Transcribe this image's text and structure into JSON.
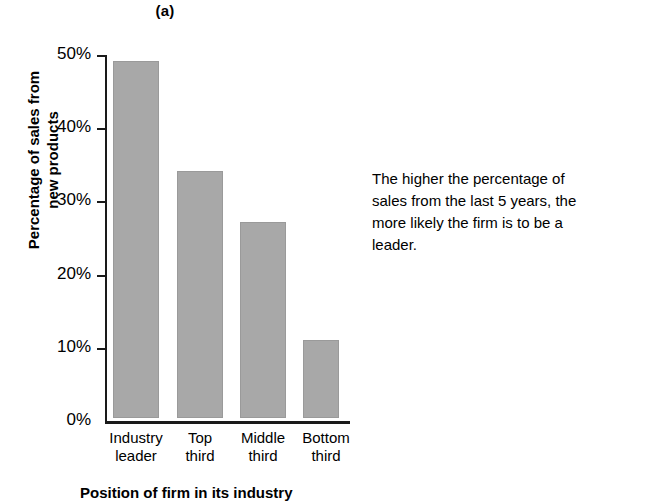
{
  "chart_data": {
    "type": "bar",
    "title": "(a)",
    "xlabel": "Position of firm in its industry",
    "ylabel_lines": [
      "Percentage of sales from",
      "new products"
    ],
    "ylabel": "Percentage of sales from new products",
    "categories": [
      "Industry leader",
      "Top third",
      "Middle third",
      "Bottom third"
    ],
    "category_lines": [
      [
        "Industry",
        "leader"
      ],
      [
        "Top",
        "third"
      ],
      [
        "Middle",
        "third"
      ],
      [
        "Bottom",
        "third"
      ]
    ],
    "values": [
      49.2,
      34.0,
      27.0,
      10.7
    ],
    "value_labels": [
      "49.2%",
      "34.0%",
      "27.0%",
      "10.7%"
    ],
    "ylim": [
      0,
      50
    ],
    "ytick_values": [
      50,
      40,
      30,
      20,
      10,
      0
    ],
    "ytick_labels": [
      "50%",
      "40%",
      "30%",
      "20%",
      "10%",
      "0%"
    ],
    "grid": false,
    "legend": null,
    "bar_color": "#a8a8a8",
    "bar_edge_color": "#9a9a9a",
    "axis_color": "#1a1a1a"
  },
  "annotation": {
    "lines": [
      "The higher the percentage of",
      "sales from the last 5 years, the",
      "more likely the firm is to be a",
      "leader."
    ],
    "text": "The higher the percentage of sales from the last 5 years, the more likely the firm is to be a leader."
  }
}
